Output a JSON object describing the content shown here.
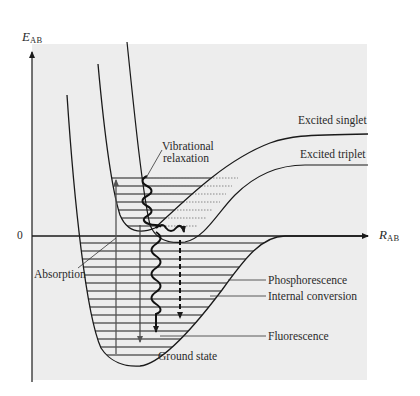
{
  "diagram": {
    "title": "",
    "axes": {
      "y_label_main": "E",
      "y_label_sub": "AB",
      "x_label_main": "R",
      "x_label_sub": "AB",
      "zero_label": "0"
    },
    "curves": {
      "excited_singlet": "Excited singlet",
      "excited_triplet": "Excited triplet",
      "ground_state": "Ground state"
    },
    "processes": {
      "vibrational_relaxation_line1": "Vibrational",
      "vibrational_relaxation_line2": "relaxation",
      "absorption": "Absorption",
      "phosphorescence": "Phosphorescence",
      "internal_conversion": "Internal conversion",
      "fluorescence": "Fluorescence"
    },
    "colors": {
      "panel_background": "#ededed",
      "line": "#1a1a1a",
      "dotted_levels": "#888888"
    }
  }
}
